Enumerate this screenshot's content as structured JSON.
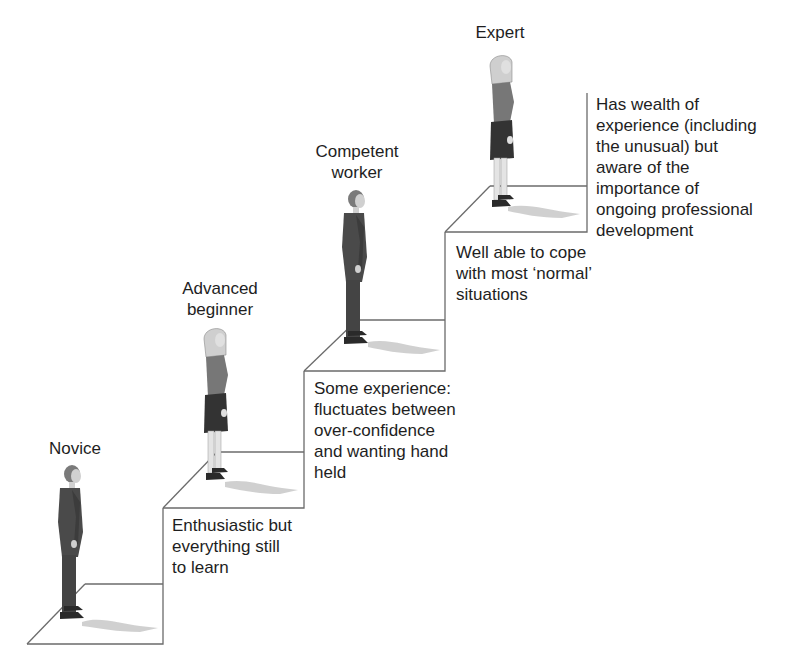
{
  "diagram": {
    "type": "staircase-progression",
    "stages": [
      {
        "name": "Novice",
        "label_lines": [
          "Novice"
        ],
        "description_lines": [
          "Enthusiastic but",
          "everything still",
          "to learn"
        ],
        "figure": "man-in-suit"
      },
      {
        "name": "Advanced beginner",
        "label_lines": [
          "Advanced",
          "beginner"
        ],
        "description_lines": [
          "Some experience:",
          "fluctuates between",
          "over-confidence",
          "and wanting hand",
          "held"
        ],
        "figure": "woman-in-skirt"
      },
      {
        "name": "Competent worker",
        "label_lines": [
          "Competent",
          "worker"
        ],
        "description_lines": [
          "Well able to cope",
          "with most ‘normal’",
          "situations"
        ],
        "figure": "man-in-suit"
      },
      {
        "name": "Expert",
        "label_lines": [
          "Expert"
        ],
        "description_lines": [
          "Has wealth of",
          "experience (including",
          "the unusual) but",
          "aware of the",
          "importance of",
          "ongoing professional",
          "development"
        ],
        "figure": "woman-in-skirt"
      }
    ],
    "colors": {
      "line": "#6b6b6b",
      "text": "#1e1e1e",
      "suit": "#4a4a4a",
      "skirt": "#3a3a3a",
      "top": "#7a7a7a",
      "skin": "#d8d8d8",
      "hair": "#c8c8c8",
      "shadow": "#c4c4c4"
    }
  }
}
